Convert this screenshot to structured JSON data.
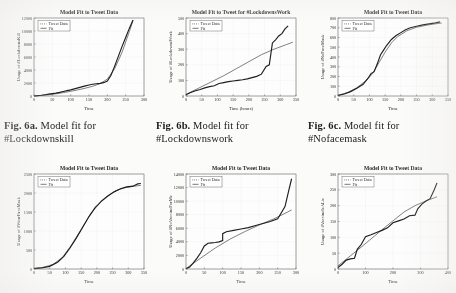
{
  "page": {
    "background_color": "#fbfbfa",
    "ink_color": "#2a2a2a"
  },
  "captions": [
    {
      "label": "Fig. 6a.",
      "text": "Model fit for",
      "line2": "#Lockdownskill"
    },
    {
      "label": "Fig. 6b.",
      "text": "Model fit for",
      "line2": "#Lockdownswork"
    },
    {
      "label": "Fig. 6c.",
      "text": "Model fit for",
      "line2": "#Nofacemask"
    }
  ],
  "legend": {
    "data_label": "Tweet Data",
    "fit_label": "Fit"
  },
  "chart_data": [
    {
      "id": "lockdownskill",
      "type": "line",
      "title": "Model Fit to Tweet Data",
      "xlabel": "Time",
      "ylabel": "Usage of #LockdownsKill",
      "xlim": [
        0,
        300
      ],
      "ylim": [
        0,
        12000
      ],
      "xticks": [
        0,
        50,
        100,
        150,
        200,
        250,
        300
      ],
      "yticks": [
        0,
        2000,
        4000,
        6000,
        8000,
        10000,
        12000
      ],
      "grid": true,
      "legend_position": "upper-left",
      "series": [
        {
          "name": "Tweet Data",
          "x": [
            0,
            10,
            20,
            30,
            40,
            50,
            60,
            70,
            80,
            90,
            100,
            110,
            120,
            130,
            140,
            150,
            160,
            170,
            180,
            190,
            200,
            210,
            220,
            230,
            240,
            250,
            260,
            270
          ],
          "values": [
            20,
            60,
            120,
            200,
            280,
            360,
            450,
            560,
            700,
            820,
            950,
            1100,
            1250,
            1400,
            1550,
            1700,
            1800,
            1880,
            1950,
            2050,
            2300,
            3200,
            4600,
            6100,
            7600,
            9000,
            10400,
            11700
          ]
        },
        {
          "name": "Fit",
          "x": [
            0,
            20,
            40,
            60,
            80,
            100,
            120,
            140,
            160,
            180,
            200,
            220,
            240,
            260,
            270
          ],
          "values": [
            10,
            90,
            200,
            340,
            520,
            720,
            950,
            1200,
            1500,
            1900,
            2600,
            4200,
            6700,
            9900,
            11600
          ]
        }
      ]
    },
    {
      "id": "lockdownswork",
      "type": "line",
      "title": "Model Fit to Tweet for #LockdownsWork",
      "xlabel": "Time (hours)",
      "ylabel": "Usage of #LockdownsWork",
      "xlim": [
        0,
        350
      ],
      "ylim": [
        0,
        500
      ],
      "xticks": [
        0,
        50,
        100,
        150,
        200,
        250,
        300,
        350
      ],
      "yticks": [
        0,
        100,
        200,
        300,
        400,
        500
      ],
      "grid": true,
      "legend_position": "upper-left",
      "series": [
        {
          "name": "Tweet Data",
          "x": [
            0,
            15,
            30,
            45,
            60,
            75,
            90,
            105,
            120,
            135,
            150,
            165,
            180,
            195,
            210,
            225,
            240,
            255,
            265,
            275,
            285,
            295,
            305,
            315,
            325
          ],
          "values": [
            8,
            22,
            34,
            42,
            52,
            60,
            66,
            80,
            86,
            92,
            96,
            100,
            104,
            110,
            118,
            126,
            140,
            190,
            200,
            340,
            360,
            385,
            400,
            430,
            450
          ]
        },
        {
          "name": "Fit",
          "x": [
            0,
            40,
            80,
            120,
            160,
            200,
            240,
            280,
            320,
            340
          ],
          "values": [
            10,
            50,
            90,
            130,
            175,
            220,
            265,
            300,
            330,
            345
          ]
        }
      ]
    },
    {
      "id": "nofacemask",
      "type": "line",
      "title": "Model Fit to Tweet Data",
      "xlabel": "Time",
      "ylabel": "Usage of #NoFaceMask",
      "xlim": [
        0,
        350
      ],
      "ylim": [
        0,
        800
      ],
      "xticks": [
        0,
        50,
        100,
        150,
        200,
        250,
        300,
        350
      ],
      "yticks": [
        0,
        100,
        200,
        300,
        400,
        500,
        600,
        700,
        800
      ],
      "grid": true,
      "legend_position": "upper-left",
      "series": [
        {
          "name": "Tweet Data",
          "x": [
            0,
            20,
            40,
            60,
            80,
            95,
            105,
            115,
            125,
            135,
            145,
            155,
            170,
            185,
            200,
            215,
            230,
            250,
            270,
            290,
            310,
            325
          ],
          "values": [
            5,
            20,
            45,
            80,
            120,
            180,
            230,
            250,
            330,
            420,
            470,
            520,
            580,
            620,
            650,
            680,
            700,
            715,
            730,
            740,
            750,
            760
          ]
        },
        {
          "name": "Fit",
          "x": [
            0,
            30,
            60,
            90,
            110,
            130,
            150,
            170,
            190,
            220,
            250,
            280,
            310,
            330
          ],
          "values": [
            8,
            35,
            85,
            160,
            230,
            340,
            450,
            545,
            610,
            670,
            705,
            725,
            740,
            748
          ]
        }
      ]
    },
    {
      "id": "wearfacemask",
      "type": "line",
      "title": "Model Fit to Tweet Data",
      "xlabel": "Time",
      "ylabel": "Usage of #WearFaceMask",
      "xlim": [
        0,
        350
      ],
      "ylim": [
        0,
        2500
      ],
      "xticks": [
        0,
        50,
        100,
        150,
        200,
        250,
        300,
        350
      ],
      "yticks": [
        0,
        500,
        1000,
        1500,
        2000,
        2500
      ],
      "grid": true,
      "legend_position": "upper-left",
      "series": [
        {
          "name": "Tweet Data",
          "x": [
            0,
            25,
            50,
            75,
            95,
            115,
            135,
            155,
            175,
            195,
            205,
            215,
            235,
            255,
            275,
            295,
            315,
            330,
            340
          ],
          "values": [
            10,
            30,
            70,
            180,
            330,
            560,
            820,
            1100,
            1380,
            1620,
            1700,
            1790,
            1920,
            2030,
            2110,
            2160,
            2180,
            2240,
            2250
          ]
        },
        {
          "name": "Fit",
          "x": [
            0,
            30,
            60,
            90,
            120,
            150,
            180,
            205,
            230,
            260,
            290,
            320,
            340
          ],
          "values": [
            15,
            45,
            120,
            300,
            640,
            1040,
            1450,
            1700,
            1900,
            2060,
            2140,
            2180,
            2200
          ]
        }
      ]
    },
    {
      "id": "novaccineforme",
      "type": "line",
      "title": "Model Fit to Tweet Data",
      "xlabel": "Time",
      "ylabel": "Usage of #NoVaccineForMe",
      "xlim": [
        0,
        300
      ],
      "ylim": [
        0,
        14000
      ],
      "xticks": [
        0,
        50,
        100,
        150,
        200,
        250,
        300
      ],
      "yticks": [
        0,
        2000,
        4000,
        6000,
        8000,
        10000,
        12000,
        14000
      ],
      "grid": true,
      "legend_position": "upper-left",
      "series": [
        {
          "name": "Tweet Data",
          "x": [
            0,
            10,
            20,
            30,
            40,
            50,
            60,
            70,
            80,
            90,
            100,
            100,
            110,
            130,
            150,
            170,
            190,
            210,
            230,
            250,
            260,
            270,
            280,
            288
          ],
          "values": [
            50,
            300,
            900,
            1600,
            2400,
            3400,
            3800,
            3850,
            3900,
            4000,
            4200,
            5200,
            5500,
            5700,
            5900,
            6100,
            6400,
            6700,
            7000,
            7400,
            8300,
            9200,
            11500,
            13300
          ]
        },
        {
          "name": "Fit",
          "x": [
            0,
            40,
            80,
            120,
            160,
            200,
            240,
            270,
            288
          ],
          "values": [
            60,
            1600,
            3100,
            4400,
            5500,
            6500,
            7400,
            8200,
            8700
          ]
        }
      ]
    },
    {
      "id": "vaccineisalie",
      "type": "line",
      "title": "Model Fit to Tweet Data",
      "xlabel": "Time",
      "ylabel": "Usage of #VaccineIsALie",
      "xlim": [
        0,
        400
      ],
      "ylim": [
        0,
        300
      ],
      "xticks": [
        0,
        100,
        200,
        300,
        400
      ],
      "yticks": [
        0,
        50,
        100,
        150,
        200,
        250,
        300
      ],
      "grid": true,
      "legend_position": "upper-left",
      "series": [
        {
          "name": "Tweet Data",
          "x": [
            0,
            15,
            30,
            45,
            60,
            70,
            85,
            100,
            120,
            140,
            160,
            180,
            200,
            220,
            240,
            260,
            280,
            290,
            305,
            320,
            335,
            350,
            360
          ],
          "values": [
            5,
            15,
            28,
            32,
            34,
            62,
            78,
            102,
            108,
            115,
            122,
            130,
            146,
            152,
            158,
            168,
            170,
            190,
            205,
            215,
            222,
            250,
            272
          ]
        },
        {
          "name": "Fit",
          "x": [
            0,
            40,
            80,
            120,
            160,
            200,
            240,
            280,
            320,
            360
          ],
          "values": [
            10,
            38,
            66,
            95,
            124,
            152,
            180,
            200,
            215,
            228
          ]
        }
      ]
    }
  ]
}
